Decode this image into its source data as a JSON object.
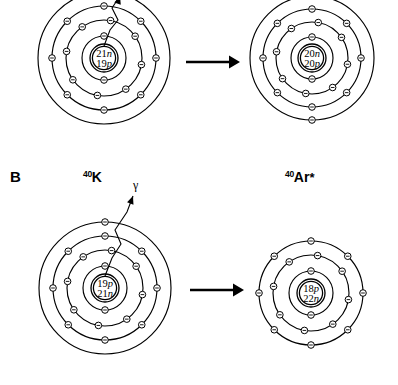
{
  "figure": {
    "background": "#ffffff",
    "ink": "#000000",
    "width": 398,
    "height": 385
  },
  "panels": [
    {
      "id": "panel-a",
      "letter": "",
      "letter_visible": false,
      "cropped_top": true,
      "parent": {
        "name": "parent-atom-panel-a",
        "label_mass": "",
        "label_symbol": "",
        "label_star": "",
        "nucleus_line1": "21n",
        "nucleus_line2": "19p",
        "neutrons": 21,
        "protons": 19,
        "shells": 4,
        "shell_electrons": [
          2,
          8,
          8,
          1
        ],
        "cx": 104,
        "cy": 58,
        "shell_radii": [
          22,
          38,
          52,
          66
        ]
      },
      "daughter": {
        "name": "daughter-atom-panel-a",
        "label_mass": "",
        "label_symbol": "",
        "label_star": "",
        "nucleus_line1": "20n",
        "nucleus_line2": "20p",
        "neutrons": 20,
        "protons": 20,
        "shells": 4,
        "shell_electrons": [
          2,
          8,
          8,
          2
        ],
        "cx": 312,
        "cy": 58,
        "shell_radii": [
          21,
          36,
          49,
          62
        ]
      },
      "arrow": {
        "name": "reaction-arrow-panel-a",
        "x1": 186,
        "y1": 62,
        "x2": 240,
        "y2": 62
      },
      "emission": {
        "name": "beta-emission-path",
        "symbol": "",
        "label_x": 0,
        "label_y": 0,
        "visible_label": false
      }
    },
    {
      "id": "panel-b",
      "letter": "B",
      "letter_visible": true,
      "letter_x": 10,
      "letter_y": 176,
      "cropped_top": false,
      "parent": {
        "name": "parent-atom-panel-b",
        "label_mass": "40",
        "label_symbol": "K",
        "label_star": "",
        "label_x": 83,
        "label_y": 177,
        "nucleus_line1": "19p",
        "nucleus_line2": "21n",
        "neutrons": 21,
        "protons": 19,
        "shells": 4,
        "shell_electrons": [
          2,
          8,
          8,
          1
        ],
        "cx": 105,
        "cy": 288,
        "shell_radii": [
          22,
          38,
          52,
          66
        ]
      },
      "daughter": {
        "name": "daughter-atom-panel-b",
        "label_mass": "40",
        "label_symbol": "Ar",
        "label_star": "*",
        "label_x": 285,
        "label_y": 177,
        "nucleus_line1": "18p",
        "nucleus_line2": "22n",
        "neutrons": 22,
        "protons": 18,
        "shells": 3,
        "shell_electrons": [
          2,
          8,
          8
        ],
        "cx": 311,
        "cy": 293,
        "shell_radii": [
          22,
          38,
          52
        ]
      },
      "arrow": {
        "name": "reaction-arrow-panel-b",
        "x1": 190,
        "y1": 290,
        "x2": 244,
        "y2": 290
      },
      "emission": {
        "name": "gamma-emission-path",
        "symbol": "γ",
        "label_x": 135,
        "label_y": 185,
        "visible_label": true
      }
    }
  ],
  "legend": {
    "electron_glyph": "electron-minus-circle",
    "nucleus_note_italic_letters": [
      "n",
      "p"
    ]
  }
}
